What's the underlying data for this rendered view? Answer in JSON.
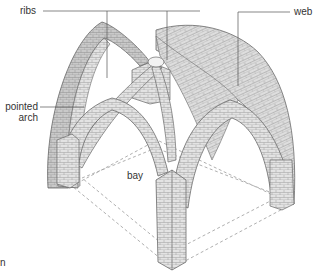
{
  "diagram": {
    "labels": {
      "ribs": "ribs",
      "web": "web",
      "pointed_arch_line1": "pointed",
      "pointed_arch_line2": "arch",
      "bay": "bay",
      "cropped_char": "n"
    },
    "colors": {
      "stone_light": "#e4e4e4",
      "stone_mid": "#cfcfcf",
      "stone_dark": "#b9b9b9",
      "outline": "#6a6a6a",
      "leader": "#555555",
      "bay_dash": "#9a9a9a"
    }
  }
}
